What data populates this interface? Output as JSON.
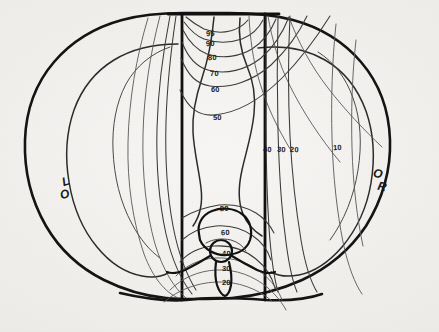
{
  "figure": {
    "type": "isodose-distribution",
    "modality": "transverse body cross-section",
    "background_color": "#efedea",
    "ink_color": "#1a1a1a",
    "width": 439,
    "height": 332
  },
  "orientation_markers": [
    {
      "name": "left-marker",
      "chars": [
        "L",
        "O"
      ],
      "x": 58,
      "y": 176
    },
    {
      "name": "right-marker",
      "chars": [
        "O",
        "R"
      ],
      "x": 372,
      "y": 168
    }
  ],
  "isodose_labels": [
    {
      "value": "95",
      "x": 206,
      "y": 30
    },
    {
      "value": "90",
      "x": 206,
      "y": 40
    },
    {
      "value": "80",
      "x": 208,
      "y": 54
    },
    {
      "value": "70",
      "x": 210,
      "y": 70
    },
    {
      "value": "60",
      "x": 211,
      "y": 86
    },
    {
      "value": "50",
      "x": 213,
      "y": 114
    },
    {
      "value": "40",
      "x": 263,
      "y": 146
    },
    {
      "value": "30",
      "x": 277,
      "y": 146
    },
    {
      "value": "20",
      "x": 290,
      "y": 146
    },
    {
      "value": "10",
      "x": 333,
      "y": 144
    },
    {
      "value": "80",
      "x": 220,
      "y": 205
    },
    {
      "value": "60",
      "x": 221,
      "y": 229
    },
    {
      "value": "40",
      "x": 222,
      "y": 250
    },
    {
      "value": "30",
      "x": 222,
      "y": 265
    },
    {
      "value": "20",
      "x": 222,
      "y": 279
    }
  ],
  "chart_data": {
    "type": "contour",
    "title": "",
    "xlabel": "",
    "ylabel": "",
    "contour_levels": [
      95,
      90,
      80,
      70,
      60,
      50,
      40,
      30,
      20,
      10
    ],
    "level_unit": "percent of prescribed dose",
    "beam_edges": [
      {
        "name": "left-beam-edge",
        "x": 182
      },
      {
        "name": "right-beam-edge",
        "x": 265
      }
    ],
    "anatomy": [
      "body-outline",
      "lung-left",
      "lung-right",
      "mediastinum",
      "vertebral-body",
      "spinal-canal",
      "spinous-process"
    ],
    "legend": "none",
    "grid": false
  }
}
